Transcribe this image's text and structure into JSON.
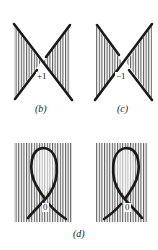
{
  "figures": {
    "b": {
      "caption": "(b)",
      "crossing_sign": "+1",
      "type": "crossing",
      "over_strand": "top-left to bottom-right"
    },
    "c": {
      "caption": "(c)",
      "crossing_sign": "−1",
      "type": "crossing",
      "over_strand": "top-right to bottom-left"
    },
    "d": {
      "caption": "(d)",
      "left": {
        "crossing_sign": "0",
        "type": "kink-loop"
      },
      "right": {
        "crossing_sign": "0",
        "type": "kink-loop"
      }
    }
  },
  "colors": {
    "stroke": "#1a1a1a",
    "hatch": "#3a3a3a",
    "background": "#ffffff"
  }
}
